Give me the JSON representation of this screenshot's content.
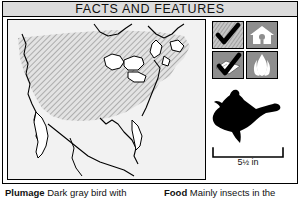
{
  "header": {
    "title": "FACTS AND FEATURES"
  },
  "map": {
    "name": "north-america-range-map",
    "description": "Range map of North America with diagonal hatched shading over the United States and southern Canada",
    "shading": "diagonal-hatch",
    "background_color": "#f2f2f2",
    "range_fill_color": "#c9c9c9",
    "outline_color": "#000000"
  },
  "icons": [
    {
      "name": "checkmark-habitat-icon",
      "label": "checkmark-over-textured-ground",
      "glyph": "check"
    },
    {
      "name": "birdhouse-icon",
      "label": "birdhouse",
      "glyph": "birdhouse"
    },
    {
      "name": "checkmark-feeder-icon",
      "label": "checkmark-over-open-book",
      "glyph": "check-book"
    },
    {
      "name": "flower-icon",
      "label": "tulip-flower",
      "glyph": "flower"
    }
  ],
  "bird": {
    "name": "bird-silhouette",
    "description": "Black silhouette of a bird in flight, facing left",
    "color": "#000000"
  },
  "scale": {
    "value": "5",
    "fraction": "½",
    "unit": " in",
    "full_label": "5½ in"
  },
  "captions": {
    "plumage": {
      "label": "Plumage",
      "text": " Dark gray bird with"
    },
    "food": {
      "label": "Food",
      "text": " Mainly insects in the"
    }
  },
  "colors": {
    "title_bar": "#dcdcdc",
    "icon_cell_bg": "#8e8e8e",
    "frame": "#000000",
    "page_bg": "#ffffff"
  }
}
